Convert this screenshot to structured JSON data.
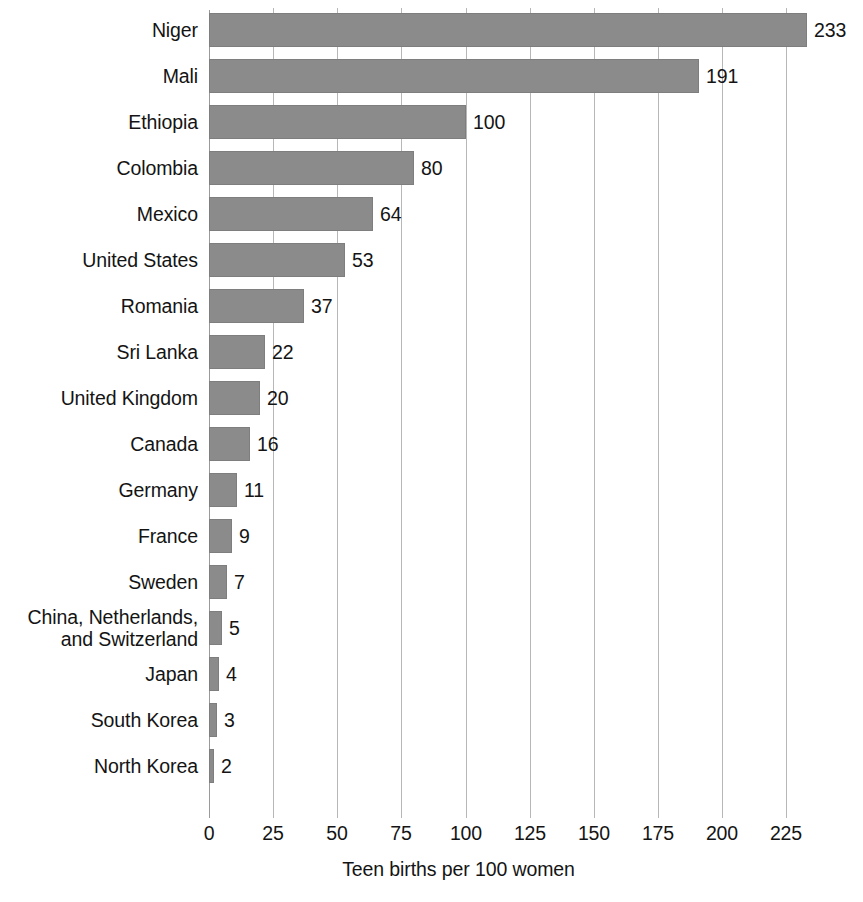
{
  "chart_data": {
    "type": "bar",
    "orientation": "horizontal",
    "title": "",
    "subtitle": "",
    "xlabel": "Teen births per 100 women",
    "ylabel": "",
    "xlim": [
      0,
      233
    ],
    "xticks": [
      0,
      25,
      50,
      75,
      100,
      125,
      150,
      175,
      200,
      225
    ],
    "xtick_labels": [
      "0",
      "25",
      "50",
      "75",
      "100",
      "125",
      "150",
      "175",
      "200",
      "225"
    ],
    "grid": "vertical",
    "legend": "none",
    "bar_color": "#8b8b8b",
    "bar_edge_color": "#7e7e7e",
    "gridline_color": "#b7b7b7",
    "background_color": "#ffffff",
    "text_color": "#141414",
    "value_labels_shown": true,
    "categories": [
      "Niger",
      "Mali",
      "Ethiopia",
      "Colombia",
      "Mexico",
      "United States",
      "Romania",
      "Sri Lanka",
      "United Kingdom",
      "Canada",
      "Germany",
      "France",
      "Sweden",
      "China, Netherlands,\nand Switzerland",
      "Japan",
      "South Korea",
      "North Korea"
    ],
    "values": [
      233,
      191,
      100,
      80,
      64,
      53,
      37,
      22,
      20,
      16,
      11,
      9,
      7,
      5,
      4,
      3,
      2
    ],
    "value_label_texts": [
      "233",
      "191",
      "100",
      "80",
      "64",
      "53",
      "37",
      "22",
      "20",
      "16",
      "11",
      "9",
      "7",
      "5",
      "4",
      "3",
      "2"
    ],
    "rows": [
      {
        "label": "Niger",
        "value": 233,
        "value_label": "233"
      },
      {
        "label": "Mali",
        "value": 191,
        "value_label": "191"
      },
      {
        "label": "Ethiopia",
        "value": 100,
        "value_label": "100"
      },
      {
        "label": "Colombia",
        "value": 80,
        "value_label": "80"
      },
      {
        "label": "Mexico",
        "value": 64,
        "value_label": "64"
      },
      {
        "label": "United States",
        "value": 53,
        "value_label": "53"
      },
      {
        "label": "Romania",
        "value": 37,
        "value_label": "37"
      },
      {
        "label": "Sri Lanka",
        "value": 22,
        "value_label": "22"
      },
      {
        "label": "United Kingdom",
        "value": 20,
        "value_label": "20"
      },
      {
        "label": "Canada",
        "value": 16,
        "value_label": "16"
      },
      {
        "label": "Germany",
        "value": 11,
        "value_label": "11"
      },
      {
        "label": "France",
        "value": 9,
        "value_label": "9"
      },
      {
        "label": "Sweden",
        "value": 7,
        "value_label": "7"
      },
      {
        "label": "China, Netherlands,\nand Switzerland",
        "value": 5,
        "value_label": "5"
      },
      {
        "label": "Japan",
        "value": 4,
        "value_label": "4"
      },
      {
        "label": "South Korea",
        "value": 3,
        "value_label": "3"
      },
      {
        "label": "North Korea",
        "value": 2,
        "value_label": "2"
      }
    ]
  }
}
